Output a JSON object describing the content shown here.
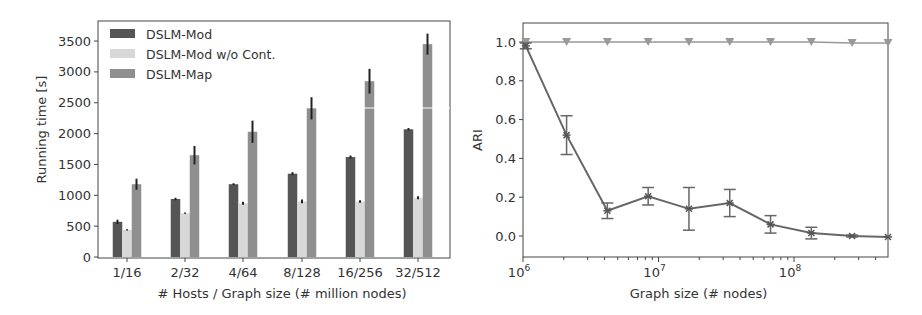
{
  "chart_data": [
    {
      "type": "bar",
      "title": "",
      "xlabel": "# Hosts / Graph size (# million nodes)",
      "ylabel": "Running time [s]",
      "ylim": [
        0,
        3800
      ],
      "yticks": [
        0,
        500,
        1000,
        1500,
        2000,
        2500,
        3000,
        3500
      ],
      "grid": false,
      "legend_position": "upper left",
      "categories": [
        "1/16",
        "2/32",
        "4/64",
        "8/128",
        "16/256",
        "32/512"
      ],
      "series": [
        {
          "name": "DSLM-Mod",
          "color": "#555555",
          "values": [
            570,
            940,
            1180,
            1350,
            1620,
            2070
          ],
          "errors": [
            35,
            20,
            15,
            25,
            25,
            20
          ]
        },
        {
          "name": "DSLM-Mod w/o Cont.",
          "color": "#d8d8d8",
          "values": [
            440,
            710,
            870,
            900,
            900,
            960
          ],
          "errors": [
            10,
            10,
            25,
            30,
            20,
            25
          ]
        },
        {
          "name": "DSLM-Map",
          "color": "#8f8f8f",
          "values": [
            1180,
            1650,
            2030,
            2410,
            2850,
            3450
          ],
          "errors": [
            90,
            150,
            180,
            180,
            200,
            170
          ]
        }
      ]
    },
    {
      "type": "line",
      "title": "",
      "xlabel": "Graph size (# nodes)",
      "ylabel": "ARI",
      "xscale": "log",
      "xlim": [
        1000000,
        500000000
      ],
      "ylim": [
        -0.1,
        1.1
      ],
      "yticks": [
        0.0,
        0.2,
        0.4,
        0.6,
        0.8,
        1.0
      ],
      "ytick_labels": [
        "0.0",
        "0.2",
        "0.4",
        "0.6",
        "0.8",
        "1.0"
      ],
      "xticks": [
        1000000,
        10000000,
        100000000
      ],
      "xtick_labels": [
        {
          "base": "10",
          "exp": "6"
        },
        {
          "base": "10",
          "exp": "7"
        },
        {
          "base": "10",
          "exp": "8"
        }
      ],
      "grid": false,
      "x": [
        1048576,
        2097152,
        4194304,
        8388608,
        16777216,
        33554432,
        67108864,
        134217728,
        268435456,
        536870912
      ],
      "series": [
        {
          "name": "upper (triangle markers)",
          "color": "#999999",
          "marker": "triangle-down",
          "values": [
            1.0,
            1.0,
            1.0,
            1.0,
            1.0,
            1.0,
            1.0,
            1.0,
            0.995,
            0.995
          ],
          "errors": [
            0,
            0,
            0,
            0,
            0,
            0,
            0,
            0,
            0,
            0
          ]
        },
        {
          "name": "lower (star markers)",
          "color": "#666666",
          "marker": "star",
          "values": [
            0.98,
            0.52,
            0.13,
            0.205,
            0.14,
            0.17,
            0.06,
            0.015,
            0.0,
            -0.005
          ],
          "errors": [
            0.015,
            0.1,
            0.04,
            0.045,
            0.11,
            0.07,
            0.045,
            0.03,
            0.005,
            0.003
          ]
        }
      ]
    }
  ]
}
